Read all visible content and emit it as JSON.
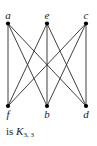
{
  "diagram": {
    "type": "bipartite-graph",
    "name": "K3,3",
    "vertices": [
      {
        "id": "a",
        "label": "a",
        "part": "top",
        "slot": 0
      },
      {
        "id": "e",
        "label": "e",
        "part": "top",
        "slot": 1
      },
      {
        "id": "c",
        "label": "c",
        "part": "top",
        "slot": 2
      },
      {
        "id": "f",
        "label": "f",
        "part": "bottom",
        "slot": 0
      },
      {
        "id": "b",
        "label": "b",
        "part": "bottom",
        "slot": 1
      },
      {
        "id": "d",
        "label": "d",
        "part": "bottom",
        "slot": 2
      }
    ],
    "edges": [
      [
        "a",
        "f"
      ],
      [
        "a",
        "b"
      ],
      [
        "a",
        "d"
      ],
      [
        "e",
        "f"
      ],
      [
        "e",
        "b"
      ],
      [
        "e",
        "d"
      ],
      [
        "c",
        "f"
      ],
      [
        "c",
        "b"
      ],
      [
        "c",
        "d"
      ]
    ]
  },
  "caption": {
    "prefix": "is ",
    "graph_symbol": "K",
    "subscript": "3, 3"
  },
  "colors": {
    "edge": "#2a2a2a",
    "vertex": "#000000",
    "background": "#ffffff"
  }
}
